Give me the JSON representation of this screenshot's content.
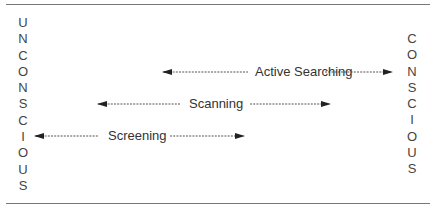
{
  "diagram": {
    "left_column": {
      "word": "UNCONSCIOUS",
      "letters": [
        "U",
        "N",
        "C",
        "O",
        "N",
        "S",
        "C",
        "I",
        "O",
        "U",
        "S"
      ]
    },
    "right_column": {
      "word": "CONSCIOUS",
      "letters": [
        "C",
        "O",
        "N",
        "S",
        "C",
        "I",
        "O",
        "U",
        "S"
      ]
    },
    "arrows": [
      {
        "label": "Active Searching",
        "x_start": 163,
        "x_end": 392,
        "y": 72
      },
      {
        "label": "Scanning",
        "x_start": 98,
        "x_end": 330,
        "y": 104
      },
      {
        "label": "Screening",
        "x_start": 35,
        "x_end": 244,
        "y": 136
      }
    ],
    "line_color": "#777777",
    "text_color": "#333333"
  }
}
